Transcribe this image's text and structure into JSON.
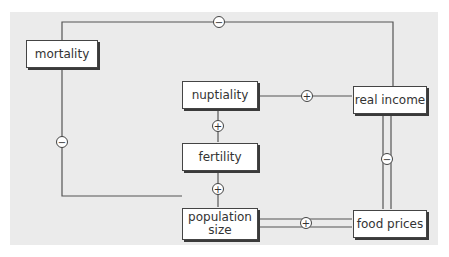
{
  "diagram": {
    "nodes": {
      "mortality": "mortality",
      "nuptiality": "nuptiality",
      "fertility": "fertility",
      "population_size_line1": "population",
      "population_size_line2": "size",
      "real_income": "real income",
      "food_prices": "food prices"
    },
    "links": [
      {
        "from": "real income",
        "to": "mortality",
        "sign": "−"
      },
      {
        "from": "mortality",
        "to": "population size",
        "sign": "−"
      },
      {
        "from": "real income",
        "to": "nuptiality",
        "sign": "+"
      },
      {
        "from": "nuptiality",
        "to": "fertility",
        "sign": "+"
      },
      {
        "from": "fertility",
        "to": "population size",
        "sign": "+"
      },
      {
        "from": "population size",
        "to": "food prices",
        "sign": "+"
      },
      {
        "from": "food prices",
        "to": "real income",
        "sign": "−"
      }
    ],
    "signs": {
      "top": "−",
      "left": "−",
      "nupt_income": "+",
      "nupt_fert": "+",
      "fert_pop": "+",
      "pop_food": "+",
      "food_income": "−"
    },
    "colors": {
      "panel": "#ebebeb",
      "line": "#555555",
      "node_border": "#444444"
    }
  }
}
